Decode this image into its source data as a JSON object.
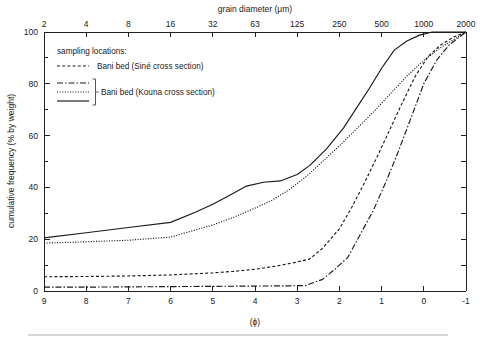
{
  "figure": {
    "background": "#ffffff",
    "ink_color": "#1a1a1a"
  },
  "chart_data": {
    "type": "line",
    "title": "",
    "xlabel": "(ϕ)",
    "ylabel": "cumulative frequency (% by weight)",
    "top_axis_label": "grain diameter (μm)",
    "xlim": [
      9,
      -1
    ],
    "ylim": [
      0,
      100
    ],
    "grid": false,
    "legend_position": "upper-left-inside",
    "legend_title": "sampling locations:",
    "x_ticks": [
      "9",
      "8",
      "7",
      "6",
      "5",
      "4",
      "3",
      "2",
      "1",
      "0",
      "-1"
    ],
    "x_tick_values": [
      9,
      8,
      7,
      6,
      5,
      4,
      3,
      2,
      1,
      0,
      -1
    ],
    "y_ticks": [
      "0",
      "20",
      "40",
      "60",
      "80",
      "100"
    ],
    "y_tick_values": [
      0,
      20,
      40,
      60,
      80,
      100
    ],
    "y_minor_tick_values": [
      10,
      30,
      50,
      70,
      90
    ],
    "top_ticks": [
      "2",
      "4",
      "8",
      "16",
      "32",
      "63",
      "125",
      "250",
      "500",
      "1000",
      "2000"
    ],
    "top_tick_phi": [
      9,
      8,
      7,
      6,
      5,
      4,
      3,
      2,
      1,
      0,
      -1
    ],
    "series": [
      {
        "name": "Bani bed (Siné cross section)",
        "style": "dashed",
        "legend_key": "curve-dashed",
        "x": [
          9,
          8,
          7,
          6,
          5,
          4.5,
          4,
          3.5,
          3,
          2.7,
          2.4,
          2.0,
          1.7,
          1.4,
          1.1,
          0.8,
          0.5,
          0.2,
          -0.1,
          -0.4,
          -0.7,
          -1
        ],
        "y": [
          5.5,
          5.6,
          5.8,
          6.2,
          7.0,
          7.6,
          8.4,
          9.6,
          11.2,
          12.4,
          16.5,
          24.0,
          32.5,
          42.0,
          52.0,
          62.5,
          73.0,
          83.0,
          90.5,
          95.0,
          98.0,
          100
        ]
      },
      {
        "name": "Bani bed (Kouna cross section) — dash-dot",
        "style": "dashdot",
        "legend_key": "curve-dashdot",
        "x": [
          9,
          8,
          7,
          6,
          5,
          4,
          3.2,
          2.8,
          2.4,
          2.1,
          1.8,
          1.5,
          1.2,
          0.9,
          0.6,
          0.3,
          0.0,
          -0.3,
          -0.6,
          -1
        ],
        "y": [
          1.5,
          1.5,
          1.6,
          1.7,
          1.8,
          1.9,
          2.0,
          2.1,
          4.5,
          8.5,
          13.0,
          22.0,
          31.0,
          42.0,
          54.0,
          67.0,
          80.0,
          89.0,
          95.0,
          100
        ]
      },
      {
        "name": "Bani bed (Kouna cross section) — dotted",
        "style": "dotted",
        "legend_key": "curve-dotted",
        "x": [
          9,
          8,
          7,
          6,
          5,
          4.5,
          4,
          3.6,
          3.2,
          2.8,
          2.4,
          2.0,
          1.6,
          1.2,
          0.8,
          0.4,
          0.0,
          -0.4,
          -0.7,
          -1
        ],
        "y": [
          18.5,
          19.0,
          19.6,
          20.8,
          25.5,
          28.5,
          32.0,
          35.0,
          39.0,
          44.0,
          50.0,
          56.0,
          62.5,
          69.0,
          76.0,
          83.0,
          89.0,
          94.0,
          97.0,
          100
        ]
      },
      {
        "name": "Bani bed (Kouna cross section) — solid",
        "style": "solid",
        "legend_key": "curve-solid",
        "x": [
          9,
          8,
          7,
          6,
          5.4,
          5,
          4.6,
          4.2,
          3.8,
          3.4,
          3.0,
          2.7,
          2.3,
          1.9,
          1.6,
          1.3,
          1.0,
          0.7,
          0.4,
          0.1,
          -0.2,
          -1
        ],
        "y": [
          20.5,
          22.5,
          24.5,
          26.5,
          30.5,
          33.5,
          37.0,
          40.5,
          42.0,
          42.5,
          45.0,
          48.5,
          55.0,
          63.0,
          70.5,
          78.0,
          86.0,
          93.0,
          96.5,
          98.8,
          100,
          100
        ]
      }
    ]
  },
  "legend": {
    "title": "sampling locations:",
    "entries": [
      {
        "label": "Bani bed (Siné cross section)",
        "key": "curve-dashed"
      },
      {
        "label": "Bani bed (Kouna cross section)",
        "key": "curve-dashdot"
      }
    ],
    "group_keys": [
      "curve-dashdot",
      "curve-dotted",
      "curve-solid"
    ]
  }
}
